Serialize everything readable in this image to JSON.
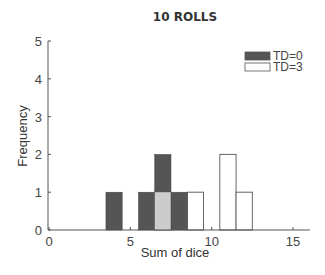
{
  "chart_data": {
    "type": "bar",
    "title": "10 ROLLS",
    "xlabel": "Sum of dice",
    "ylabel": "Frequency",
    "xlim": [
      0,
      16
    ],
    "ylim": [
      0,
      5
    ],
    "xticks": [
      0,
      5,
      10,
      15
    ],
    "yticks": [
      0,
      1,
      2,
      3,
      4,
      5
    ],
    "bin_width": 1,
    "legend_position": "upper right",
    "grid": false,
    "series": [
      {
        "name": "TD=0",
        "color": "#555555",
        "x": [
          4,
          6,
          7,
          8
        ],
        "values": [
          1,
          1,
          2,
          1
        ]
      },
      {
        "name": "TD=3",
        "color": "#ffffff",
        "x": [
          7,
          9,
          11,
          12
        ],
        "values": [
          1,
          1,
          2,
          1
        ]
      }
    ],
    "overlap_color": "#cccccc"
  }
}
